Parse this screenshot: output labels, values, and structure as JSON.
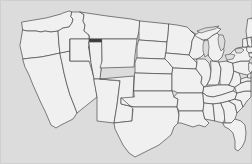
{
  "figure": {
    "kind": "us-state-locator-map",
    "width": 252,
    "height": 164,
    "background_color": "#dcdcdc",
    "frame_color": "#cfcfcf"
  },
  "legend": {
    "highlighted_label": "Wyoming",
    "highlighted_color": "#3d3d3d",
    "default_state_color": "#f0f0f0",
    "border_color": "#4a4a4a",
    "water_color": "#dcdcdc"
  },
  "chart_data": {
    "type": "map",
    "projection": "albers-usa-approximate",
    "region": "contiguous-united-states",
    "highlighted": [
      "WY"
    ],
    "value_encoding": "binary-highlight",
    "legend": {
      "visible": false,
      "entries": [
        {
          "label": "Wyoming",
          "color": "#3d3d3d",
          "value": 1
        },
        {
          "label": "Other states",
          "color": "#f0f0f0",
          "value": 0
        }
      ]
    },
    "states": [
      {
        "code": "WA",
        "name": "Washington",
        "value": 0
      },
      {
        "code": "OR",
        "name": "Oregon",
        "value": 0
      },
      {
        "code": "CA",
        "name": "California",
        "value": 0
      },
      {
        "code": "NV",
        "name": "Nevada",
        "value": 0
      },
      {
        "code": "ID",
        "name": "Idaho",
        "value": 0
      },
      {
        "code": "MT",
        "name": "Montana",
        "value": 0
      },
      {
        "code": "WY",
        "name": "Wyoming",
        "value": 1
      },
      {
        "code": "UT",
        "name": "Utah",
        "value": 0
      },
      {
        "code": "AZ",
        "name": "Arizona",
        "value": 0
      },
      {
        "code": "CO",
        "name": "Colorado",
        "value": 0
      },
      {
        "code": "NM",
        "name": "New Mexico",
        "value": 0
      },
      {
        "code": "ND",
        "name": "North Dakota",
        "value": 0
      },
      {
        "code": "SD",
        "name": "South Dakota",
        "value": 0
      },
      {
        "code": "NE",
        "name": "Nebraska",
        "value": 0
      },
      {
        "code": "KS",
        "name": "Kansas",
        "value": 0
      },
      {
        "code": "OK",
        "name": "Oklahoma",
        "value": 0
      },
      {
        "code": "TX",
        "name": "Texas",
        "value": 0
      },
      {
        "code": "MN",
        "name": "Minnesota",
        "value": 0
      },
      {
        "code": "IA",
        "name": "Iowa",
        "value": 0
      },
      {
        "code": "MO",
        "name": "Missouri",
        "value": 0
      },
      {
        "code": "AR",
        "name": "Arkansas",
        "value": 0
      },
      {
        "code": "LA",
        "name": "Louisiana",
        "value": 0
      },
      {
        "code": "WI",
        "name": "Wisconsin",
        "value": 0
      },
      {
        "code": "IL",
        "name": "Illinois",
        "value": 0
      },
      {
        "code": "MI",
        "name": "Michigan",
        "value": 0
      },
      {
        "code": "IN",
        "name": "Indiana",
        "value": 0
      },
      {
        "code": "OH",
        "name": "Ohio",
        "value": 0
      },
      {
        "code": "KY",
        "name": "Kentucky",
        "value": 0
      },
      {
        "code": "TN",
        "name": "Tennessee",
        "value": 0
      },
      {
        "code": "MS",
        "name": "Mississippi",
        "value": 0
      },
      {
        "code": "AL",
        "name": "Alabama",
        "value": 0
      },
      {
        "code": "GA",
        "name": "Georgia",
        "value": 0
      },
      {
        "code": "FL",
        "name": "Florida",
        "value": 0
      },
      {
        "code": "SC",
        "name": "South Carolina",
        "value": 0
      },
      {
        "code": "NC",
        "name": "North Carolina",
        "value": 0
      },
      {
        "code": "VA",
        "name": "Virginia",
        "value": 0
      },
      {
        "code": "WV",
        "name": "West Virginia",
        "value": 0
      },
      {
        "code": "MD",
        "name": "Maryland",
        "value": 0
      },
      {
        "code": "DE",
        "name": "Delaware",
        "value": 0
      },
      {
        "code": "PA",
        "name": "Pennsylvania",
        "value": 0
      },
      {
        "code": "NJ",
        "name": "New Jersey",
        "value": 0
      },
      {
        "code": "NY",
        "name": "New York",
        "value": 0
      },
      {
        "code": "CT",
        "name": "Connecticut",
        "value": 0
      },
      {
        "code": "RI",
        "name": "Rhode Island",
        "value": 0
      },
      {
        "code": "MA",
        "name": "Massachusetts",
        "value": 0
      },
      {
        "code": "VT",
        "name": "Vermont",
        "value": 0
      },
      {
        "code": "NH",
        "name": "New Hampshire",
        "value": 0
      },
      {
        "code": "ME",
        "name": "Maine",
        "value": 0
      }
    ],
    "water_bodies": [
      {
        "name": "Lake Superior"
      },
      {
        "name": "Lake Michigan"
      },
      {
        "name": "Lake Huron"
      },
      {
        "name": "Lake Erie"
      },
      {
        "name": "Lake Ontario"
      }
    ]
  }
}
